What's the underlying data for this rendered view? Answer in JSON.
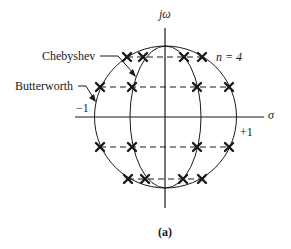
{
  "figure": {
    "caption": "(a)",
    "axes": {
      "vertical_label": "jω",
      "horizontal_label": "σ",
      "neg_one_label": "−1",
      "pos_one_label": "+1"
    },
    "order_label": "n = 4",
    "labels": {
      "chebyshev": "Chebyshev",
      "butterworth": "Butterworth"
    },
    "colors": {
      "line": "#1a1a1a",
      "background": "#ffffff"
    },
    "butterworth_poles": [
      {
        "x": 127,
        "y": 57
      },
      {
        "x": 202,
        "y": 57
      },
      {
        "x": 100,
        "y": 87
      },
      {
        "x": 229,
        "y": 87
      },
      {
        "x": 100,
        "y": 147
      },
      {
        "x": 229,
        "y": 147
      },
      {
        "x": 128,
        "y": 179
      },
      {
        "x": 202,
        "y": 179
      }
    ],
    "chebyshev_poles": [
      {
        "x": 143,
        "y": 57
      },
      {
        "x": 184,
        "y": 57
      },
      {
        "x": 132,
        "y": 87
      },
      {
        "x": 197,
        "y": 87
      },
      {
        "x": 132,
        "y": 147
      },
      {
        "x": 197,
        "y": 147
      },
      {
        "x": 145,
        "y": 179
      },
      {
        "x": 183,
        "y": 179
      }
    ]
  }
}
